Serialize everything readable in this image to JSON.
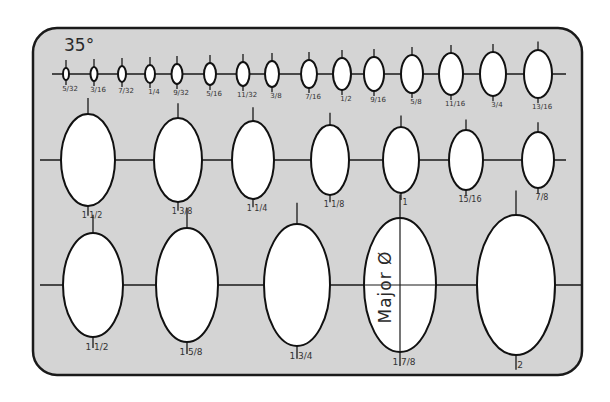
{
  "template": {
    "angle_label": "35°",
    "major_axis_label": "Major Ø",
    "colors": {
      "plate": "#d4d4d4",
      "outline": "#1a1a1a",
      "hole": "#ffffff",
      "text": "#333333"
    },
    "bounds": {
      "x": 33,
      "y": 28,
      "w": 549,
      "h": 347,
      "r": 24
    }
  },
  "rows": [
    {
      "name": "row-1",
      "axis_y": 74,
      "axis_x1": 52,
      "axis_x2": 566,
      "label_size": 7,
      "ellipses": [
        {
          "cx": 66,
          "rx": 3,
          "ry": 6,
          "label": "5/32"
        },
        {
          "cx": 94,
          "rx": 3.5,
          "ry": 7,
          "label": "3/16"
        },
        {
          "cx": 122,
          "rx": 4,
          "ry": 8,
          "label": "7/32"
        },
        {
          "cx": 150,
          "rx": 5,
          "ry": 9,
          "label": "1/4"
        },
        {
          "cx": 177,
          "rx": 5.5,
          "ry": 10,
          "label": "9/32"
        },
        {
          "cx": 210,
          "rx": 6,
          "ry": 11,
          "label": "5/16"
        },
        {
          "cx": 243,
          "rx": 6.5,
          "ry": 12,
          "label": "11/32"
        },
        {
          "cx": 272,
          "rx": 7,
          "ry": 13,
          "label": "3/8"
        },
        {
          "cx": 309,
          "rx": 8,
          "ry": 14,
          "label": "7/16"
        },
        {
          "cx": 342,
          "rx": 9,
          "ry": 16,
          "label": "1/2"
        },
        {
          "cx": 374,
          "rx": 10,
          "ry": 17,
          "label": "9/16"
        },
        {
          "cx": 412,
          "rx": 11,
          "ry": 19,
          "label": "5/8"
        },
        {
          "cx": 451,
          "rx": 12,
          "ry": 21,
          "label": "11/16"
        },
        {
          "cx": 493,
          "rx": 13,
          "ry": 22,
          "label": "3/4"
        },
        {
          "cx": 538,
          "rx": 14,
          "ry": 24,
          "label": "13/16"
        }
      ]
    },
    {
      "name": "row-2",
      "axis_y": 160,
      "axis_x1": 40,
      "axis_x2": 566,
      "label_size": 8,
      "ellipses": [
        {
          "cx": 88,
          "rx": 27,
          "ry": 46,
          "label": "1 1/2"
        },
        {
          "cx": 178,
          "rx": 24,
          "ry": 42,
          "label": "1 3/8"
        },
        {
          "cx": 253,
          "rx": 21,
          "ry": 39,
          "label": "1 1/4"
        },
        {
          "cx": 330,
          "rx": 19,
          "ry": 35,
          "label": "1 1/8"
        },
        {
          "cx": 401,
          "rx": 18,
          "ry": 33,
          "label": "1"
        },
        {
          "cx": 466,
          "rx": 17,
          "ry": 30,
          "label": "15/16"
        },
        {
          "cx": 538,
          "rx": 16,
          "ry": 28,
          "label": "7/8"
        }
      ]
    },
    {
      "name": "row-3",
      "axis_y": 285,
      "axis_x1": 40,
      "axis_x2": 582,
      "label_size": 9,
      "ellipses": [
        {
          "cx": 93,
          "rx": 30,
          "ry": 52,
          "label": "1 1/2"
        },
        {
          "cx": 187,
          "rx": 31,
          "ry": 57,
          "label": "1 5/8"
        },
        {
          "cx": 297,
          "rx": 33,
          "ry": 61,
          "label": "1 3/4"
        },
        {
          "cx": 400,
          "rx": 36,
          "ry": 67,
          "label": "1 7/8",
          "major_guide": true
        },
        {
          "cx": 516,
          "rx": 39,
          "ry": 70,
          "label": "2"
        }
      ]
    }
  ]
}
